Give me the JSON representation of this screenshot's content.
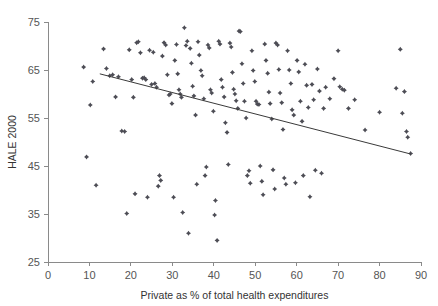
{
  "chart_data": {
    "type": "scatter",
    "title": "",
    "xlabel": "Private as % of total health expenditures",
    "ylabel": "HALE 2000",
    "xlim": [
      0,
      90
    ],
    "ylim": [
      25,
      75
    ],
    "xticks": [
      0,
      10,
      20,
      30,
      40,
      50,
      60,
      70,
      80,
      90
    ],
    "yticks": [
      25,
      35,
      45,
      55,
      65,
      75
    ],
    "grid": false,
    "legend": null,
    "marker": "diamond",
    "marker_color": "#4d4d55",
    "trendline": {
      "label": "linear fit",
      "color": "#3a3a3a",
      "x_start": 12.5,
      "y_start": 64.2,
      "x_end": 87.5,
      "y_end": 47.5
    },
    "points": [
      [
        8.6,
        65.6
      ],
      [
        9.3,
        46.9
      ],
      [
        10.2,
        57.7
      ],
      [
        10.8,
        62.6
      ],
      [
        11.6,
        41.0
      ],
      [
        13.4,
        69.4
      ],
      [
        14.1,
        65.3
      ],
      [
        14.9,
        63.8
      ],
      [
        15.6,
        64.0
      ],
      [
        16.3,
        59.4
      ],
      [
        17.0,
        63.6
      ],
      [
        17.8,
        52.3
      ],
      [
        18.5,
        52.2
      ],
      [
        19.0,
        35.1
      ],
      [
        19.6,
        69.2
      ],
      [
        20.2,
        63.0
      ],
      [
        20.6,
        59.3
      ],
      [
        21.0,
        39.2
      ],
      [
        21.4,
        70.7
      ],
      [
        21.8,
        70.9
      ],
      [
        22.3,
        68.6
      ],
      [
        22.8,
        63.3
      ],
      [
        23.2,
        63.4
      ],
      [
        23.6,
        63.0
      ],
      [
        24.0,
        38.5
      ],
      [
        24.5,
        69.1
      ],
      [
        25.0,
        62.0
      ],
      [
        25.4,
        68.7
      ],
      [
        25.8,
        62.2
      ],
      [
        26.2,
        61.4
      ],
      [
        26.6,
        40.8
      ],
      [
        26.9,
        43.0
      ],
      [
        27.2,
        42.0
      ],
      [
        27.6,
        67.9
      ],
      [
        28.0,
        70.7
      ],
      [
        28.4,
        70.2
      ],
      [
        28.8,
        64.0
      ],
      [
        29.2,
        59.8
      ],
      [
        29.5,
        60.0
      ],
      [
        29.9,
        58.0
      ],
      [
        30.3,
        38.5
      ],
      [
        30.6,
        67.0
      ],
      [
        31.0,
        70.3
      ],
      [
        31.3,
        64.2
      ],
      [
        31.6,
        60.9
      ],
      [
        31.9,
        60.0
      ],
      [
        32.2,
        59.3
      ],
      [
        32.5,
        35.3
      ],
      [
        32.9,
        73.8
      ],
      [
        33.3,
        70.1
      ],
      [
        33.6,
        71.0
      ],
      [
        33.9,
        31.0
      ],
      [
        34.3,
        69.5
      ],
      [
        34.6,
        66.4
      ],
      [
        34.9,
        61.6
      ],
      [
        35.2,
        59.6
      ],
      [
        35.6,
        55.6
      ],
      [
        35.9,
        41.2
      ],
      [
        36.2,
        70.9
      ],
      [
        36.5,
        68.1
      ],
      [
        36.9,
        64.9
      ],
      [
        37.2,
        63.8
      ],
      [
        37.6,
        59.0
      ],
      [
        37.9,
        43.0
      ],
      [
        38.2,
        44.8
      ],
      [
        38.6,
        70.2
      ],
      [
        38.9,
        69.6
      ],
      [
        39.2,
        60.9
      ],
      [
        39.5,
        60.2
      ],
      [
        39.9,
        56.4
      ],
      [
        40.2,
        34.8
      ],
      [
        40.4,
        37.8
      ],
      [
        40.8,
        29.5
      ],
      [
        41.2,
        71.0
      ],
      [
        41.5,
        70.4
      ],
      [
        41.8,
        63.0
      ],
      [
        42.1,
        61.4
      ],
      [
        42.5,
        59.4
      ],
      [
        42.8,
        54.0
      ],
      [
        43.2,
        52.0
      ],
      [
        43.5,
        45.3
      ],
      [
        43.9,
        70.6
      ],
      [
        44.2,
        69.8
      ],
      [
        44.5,
        64.5
      ],
      [
        44.8,
        61.0
      ],
      [
        45.1,
        60.0
      ],
      [
        45.4,
        58.6
      ],
      [
        45.8,
        57.0
      ],
      [
        46.1,
        73.1
      ],
      [
        46.4,
        73.0
      ],
      [
        46.8,
        66.3
      ],
      [
        47.1,
        62.2
      ],
      [
        47.4,
        58.5
      ],
      [
        47.8,
        55.0
      ],
      [
        48.1,
        43.0
      ],
      [
        48.5,
        44.0
      ],
      [
        48.8,
        41.4
      ],
      [
        49.2,
        69.0
      ],
      [
        49.5,
        64.9
      ],
      [
        49.9,
        62.6
      ],
      [
        50.2,
        58.5
      ],
      [
        50.5,
        57.9
      ],
      [
        50.9,
        57.8
      ],
      [
        51.2,
        45.0
      ],
      [
        51.6,
        41.8
      ],
      [
        51.9,
        39.0
      ],
      [
        52.3,
        70.4
      ],
      [
        52.6,
        67.0
      ],
      [
        53.0,
        64.3
      ],
      [
        53.3,
        60.4
      ],
      [
        53.6,
        58.0
      ],
      [
        54.0,
        54.8
      ],
      [
        54.3,
        44.2
      ],
      [
        54.7,
        40.2
      ],
      [
        55.0,
        70.6
      ],
      [
        55.4,
        70.2
      ],
      [
        55.7,
        65.1
      ],
      [
        56.0,
        60.2
      ],
      [
        56.4,
        58.2
      ],
      [
        56.7,
        52.6
      ],
      [
        57.0,
        42.5
      ],
      [
        57.4,
        41.2
      ],
      [
        57.8,
        69.0
      ],
      [
        58.2,
        65.0
      ],
      [
        58.6,
        62.2
      ],
      [
        58.9,
        56.7
      ],
      [
        59.3,
        55.6
      ],
      [
        59.7,
        41.5
      ],
      [
        60.1,
        67.0
      ],
      [
        60.5,
        64.6
      ],
      [
        60.9,
        58.5
      ],
      [
        61.3,
        54.3
      ],
      [
        61.6,
        43.0
      ],
      [
        62.0,
        66.2
      ],
      [
        62.4,
        61.8
      ],
      [
        62.8,
        57.2
      ],
      [
        63.2,
        38.6
      ],
      [
        63.7,
        62.0
      ],
      [
        64.1,
        58.8
      ],
      [
        64.5,
        44.1
      ],
      [
        65.0,
        65.2
      ],
      [
        65.5,
        60.6
      ],
      [
        66.0,
        43.5
      ],
      [
        66.5,
        57.0
      ],
      [
        67.0,
        61.4
      ],
      [
        68.0,
        59.0
      ],
      [
        69.0,
        63.2
      ],
      [
        70.0,
        69.0
      ],
      [
        70.4,
        61.5
      ],
      [
        71.0,
        61.0
      ],
      [
        71.5,
        60.8
      ],
      [
        72.5,
        57.0
      ],
      [
        74.0,
        58.8
      ],
      [
        76.5,
        52.5
      ],
      [
        80.0,
        56.2
      ],
      [
        84.0,
        61.2
      ],
      [
        85.0,
        69.3
      ],
      [
        85.5,
        56.0
      ],
      [
        86.0,
        60.5
      ],
      [
        86.5,
        52.2
      ],
      [
        86.8,
        51.0
      ],
      [
        87.5,
        47.6
      ]
    ]
  },
  "axes": {
    "y_title": "HALE 2000",
    "x_title": "Private as % of total health expenditures",
    "x_tick_labels": [
      "0",
      "10",
      "20",
      "30",
      "40",
      "50",
      "60",
      "70",
      "80",
      "90"
    ],
    "y_tick_labels": [
      "25",
      "35",
      "45",
      "55",
      "65",
      "75"
    ]
  }
}
